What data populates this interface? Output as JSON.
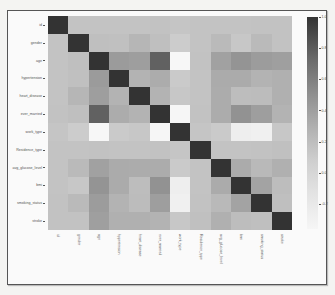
{
  "chart_data": {
    "type": "heatmap",
    "title": "",
    "xlabel": "",
    "ylabel": "",
    "labels": [
      "id",
      "gender",
      "age",
      "hypertension",
      "heart_disease",
      "ever_married",
      "work_type",
      "Residence_type",
      "avg_glucose_level",
      "bmi",
      "smoking_status",
      "stroke"
    ],
    "matrix": [
      [
        1.0,
        0.0,
        0.0,
        0.0,
        0.0,
        0.01,
        -0.01,
        0.0,
        0.0,
        0.0,
        0.01,
        0.01
      ],
      [
        0.0,
        1.0,
        0.03,
        0.02,
        0.09,
        0.03,
        -0.06,
        0.0,
        0.06,
        -0.03,
        0.06,
        0.01
      ],
      [
        0.0,
        0.03,
        1.0,
        0.28,
        0.26,
        0.68,
        -0.36,
        0.01,
        0.24,
        0.33,
        0.27,
        0.25
      ],
      [
        0.0,
        0.02,
        0.28,
        1.0,
        0.11,
        0.16,
        -0.05,
        0.0,
        0.17,
        0.17,
        0.11,
        0.13
      ],
      [
        0.0,
        0.09,
        0.26,
        0.11,
        1.0,
        0.11,
        -0.03,
        0.0,
        0.16,
        0.04,
        0.05,
        0.13
      ],
      [
        0.01,
        0.03,
        0.68,
        0.16,
        0.11,
        1.0,
        -0.35,
        0.01,
        0.16,
        0.34,
        0.26,
        0.11
      ],
      [
        -0.01,
        -0.06,
        -0.36,
        -0.05,
        -0.03,
        -0.35,
        1.0,
        -0.01,
        -0.05,
        -0.3,
        -0.31,
        -0.03
      ],
      [
        0.0,
        0.0,
        0.01,
        0.0,
        0.0,
        0.01,
        -0.01,
        1.0,
        0.0,
        -0.0,
        0.01,
        0.02
      ],
      [
        0.0,
        0.06,
        0.24,
        0.17,
        0.16,
        0.16,
        -0.05,
        0.0,
        1.0,
        0.17,
        0.07,
        0.13
      ],
      [
        0.0,
        -0.03,
        0.33,
        0.17,
        0.04,
        0.34,
        -0.3,
        -0.0,
        0.17,
        1.0,
        0.22,
        0.04
      ],
      [
        0.01,
        0.06,
        0.27,
        0.11,
        0.05,
        0.26,
        -0.31,
        0.01,
        0.07,
        0.22,
        1.0,
        0.03
      ],
      [
        0.01,
        0.01,
        0.25,
        0.13,
        0.13,
        0.11,
        -0.03,
        0.02,
        0.13,
        0.04,
        0.03,
        1.0
      ]
    ],
    "colorbar": {
      "ticks": [
        "1.0",
        "0.8",
        "0.6",
        "0.4",
        "0.2",
        "0.0",
        "-0.2"
      ],
      "tick_values": [
        1.0,
        0.8,
        0.6,
        0.4,
        0.2,
        0.0,
        -0.2
      ],
      "range": [
        -0.36,
        1.0
      ],
      "colormap": "greys"
    },
    "grid": false,
    "legend_position": "right"
  }
}
